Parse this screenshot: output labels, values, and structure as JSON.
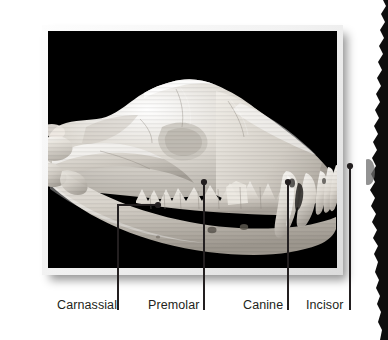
{
  "figure": {
    "kind": "labeled-photograph",
    "background_color": "#ffffff"
  },
  "photo": {
    "frame_border_color": "#e8e8e8",
    "photo_background_color": "#000000",
    "bone_color": "#d9d6d0",
    "shadow_color": "#000000"
  },
  "callouts": [
    {
      "id": "carnassial",
      "label": "Carnassial",
      "label_x": 57,
      "label_y": 298,
      "dot_x": 158,
      "dot_y": 205,
      "line_x": 118,
      "line_top": 205,
      "line_bottom": 310
    },
    {
      "id": "premolar",
      "label": "Premolar",
      "label_x": 148,
      "label_y": 298,
      "dot_x": 204,
      "dot_y": 182,
      "line_x": 204,
      "line_top": 182,
      "line_bottom": 310
    },
    {
      "id": "canine",
      "label": "Canine",
      "label_x": 243,
      "label_y": 298,
      "dot_x": 288,
      "dot_y": 182,
      "line_x": 288,
      "line_top": 182,
      "line_bottom": 310
    },
    {
      "id": "incisor",
      "label": "Incisor",
      "label_x": 306,
      "label_y": 298,
      "dot_x": 350,
      "dot_y": 166,
      "line_x": 350,
      "line_top": 166,
      "line_bottom": 310
    }
  ],
  "labels": {
    "carnassial": "Carnassial",
    "premolar": "Premolar",
    "canine": "Canine",
    "incisor": "Incisor"
  },
  "icons": {
    "leader_dot": "leader-dot-icon",
    "leader_line": "leader-line-icon",
    "edge_bleed": "edge-bleed-silhouette-icon"
  },
  "colors": {
    "label_text": "#231f20",
    "leader": "#231f20",
    "page_background": "#ffffff",
    "photo_black": "#000000",
    "frame_light": "#f4f4f4",
    "frame_shadow": "#b8b8b8"
  }
}
